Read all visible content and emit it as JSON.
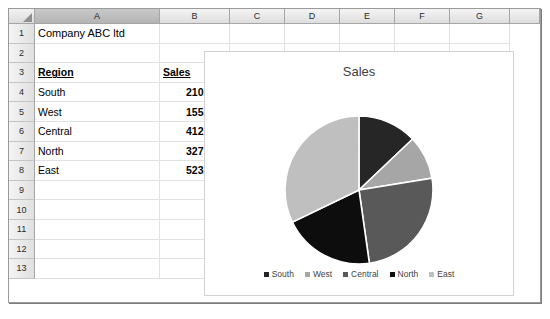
{
  "spreadsheet": {
    "select_all_icon": "select-all-triangle-icon",
    "columns": [
      {
        "label": "A",
        "selected": true,
        "width": 125
      },
      {
        "label": "B",
        "selected": false,
        "width": 70
      },
      {
        "label": "C",
        "selected": false,
        "width": 55
      },
      {
        "label": "D",
        "selected": false,
        "width": 55
      },
      {
        "label": "E",
        "selected": false,
        "width": 55
      },
      {
        "label": "F",
        "selected": false,
        "width": 55
      },
      {
        "label": "G",
        "selected": false,
        "width": 60
      },
      {
        "label": "",
        "selected": false,
        "width": 30
      }
    ],
    "rows": [
      "1",
      "2",
      "3",
      "4",
      "5",
      "6",
      "7",
      "8",
      "9",
      "10",
      "11",
      "12",
      "13"
    ],
    "cells": [
      {
        "row": 1,
        "col": "A",
        "value": "Company ABC ltd",
        "style": "title"
      },
      {
        "row": 3,
        "col": "A",
        "value": "Region",
        "style": "hdr"
      },
      {
        "row": 3,
        "col": "B",
        "value": "Sales",
        "style": "hdr"
      },
      {
        "row": 4,
        "col": "A",
        "value": "South",
        "style": "text"
      },
      {
        "row": 4,
        "col": "B",
        "value": "210,000",
        "style": "num"
      },
      {
        "row": 5,
        "col": "A",
        "value": "West",
        "style": "text"
      },
      {
        "row": 5,
        "col": "B",
        "value": "155,000",
        "style": "num"
      },
      {
        "row": 6,
        "col": "A",
        "value": "Central",
        "style": "text"
      },
      {
        "row": 6,
        "col": "B",
        "value": "412,000",
        "style": "num"
      },
      {
        "row": 7,
        "col": "A",
        "value": "North",
        "style": "text"
      },
      {
        "row": 7,
        "col": "B",
        "value": "327,000",
        "style": "num"
      },
      {
        "row": 8,
        "col": "A",
        "value": "East",
        "style": "text"
      },
      {
        "row": 8,
        "col": "B",
        "value": "523,000",
        "style": "num"
      }
    ]
  },
  "chart_data": {
    "type": "pie",
    "title": "Sales",
    "categories": [
      "South",
      "West",
      "Central",
      "North",
      "East"
    ],
    "values": [
      210000,
      155000,
      412000,
      327000,
      523000
    ],
    "colors": [
      "#262626",
      "#a6a6a6",
      "#595959",
      "#0d0d0d",
      "#bfbfbf"
    ],
    "total": 1627000,
    "percentages": [
      12.9,
      9.5,
      25.3,
      20.1,
      32.1
    ],
    "start_angle": 0,
    "direction": "clockwise",
    "legend_position": "bottom",
    "data_labels": false,
    "grid": false,
    "slice_border_color": "#ffffff"
  }
}
